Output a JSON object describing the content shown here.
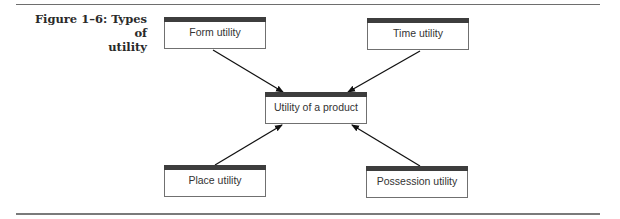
{
  "figure": {
    "caption_line1": "Figure 1–6: Types of",
    "caption_line2": "utility"
  },
  "diagram": {
    "center": {
      "id": "utility-of-a-product",
      "label": "Utility of a product"
    },
    "nodes": [
      {
        "id": "form-utility",
        "label": "Form utility"
      },
      {
        "id": "time-utility",
        "label": "Time utility"
      },
      {
        "id": "place-utility",
        "label": "Place utility"
      },
      {
        "id": "possession-utility",
        "label": "Possession utility"
      }
    ],
    "edges": [
      {
        "from": "form-utility",
        "to": "utility-of-a-product"
      },
      {
        "from": "time-utility",
        "to": "utility-of-a-product"
      },
      {
        "from": "place-utility",
        "to": "utility-of-a-product"
      },
      {
        "from": "possession-utility",
        "to": "utility-of-a-product"
      }
    ]
  }
}
